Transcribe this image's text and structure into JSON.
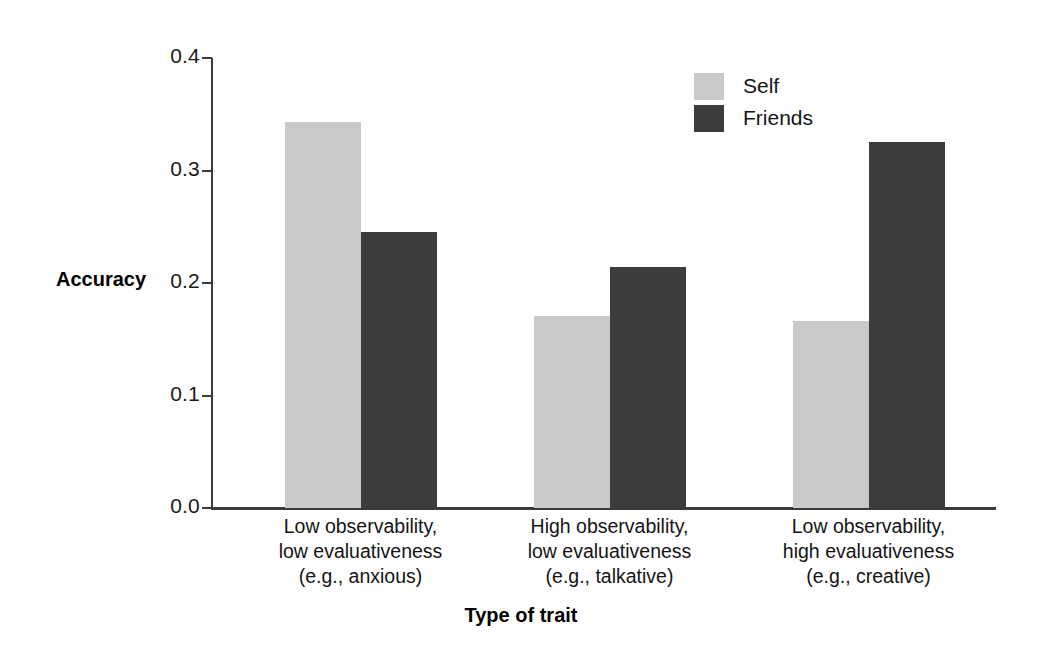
{
  "chart_data": {
    "type": "bar",
    "title": "",
    "xlabel": "Type of trait",
    "ylabel": "Accuracy",
    "ylim": [
      0.0,
      0.4
    ],
    "grid": false,
    "legend_position": "top-right",
    "categories": [
      "Low observability,\nlow evaluativeness\n(e.g., anxious)",
      "High observability,\nlow evaluativeness\n(e.g., talkative)",
      "Low observability,\nhigh evaluativeness\n(e.g., creative)"
    ],
    "ytick_labels": [
      "0.4",
      "0.3",
      "0.2",
      "0.1",
      "0.0"
    ],
    "ytick_values": [
      0.4,
      0.3,
      0.2,
      0.1,
      0.0
    ],
    "series": [
      {
        "name": "Self",
        "color": "#c9c9c9",
        "values": [
          0.343,
          0.171,
          0.166
        ]
      },
      {
        "name": "Friends",
        "color": "#3c3c3c",
        "values": [
          0.245,
          0.214,
          0.325
        ]
      }
    ]
  },
  "colors": {
    "self": "#c9c9c9",
    "friends": "#3c3c3c",
    "axis": "#3b3b3b",
    "text": "#141414",
    "background": "#ffffff"
  }
}
